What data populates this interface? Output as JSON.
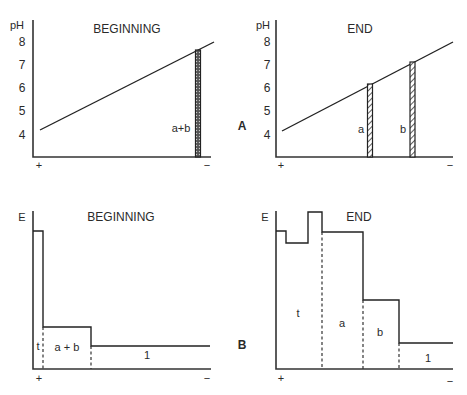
{
  "panels": {
    "A": {
      "letter": "A",
      "y_axis_label": "pH",
      "y_ticks": [
        "8",
        "7",
        "6",
        "5",
        "4"
      ],
      "x_left_sign": "+",
      "x_right_sign": "−",
      "beginning": {
        "title": "BEGINNING",
        "gradient": {
          "from_ph": 4.2,
          "to_ph": 8.0
        },
        "bands": [
          {
            "label": "a+b",
            "position_fraction": 0.92,
            "ph": 7.6
          }
        ]
      },
      "end": {
        "title": "END",
        "gradient": {
          "from_ph": 4.2,
          "to_ph": 8.0
        },
        "bands": [
          {
            "label": "a",
            "position_fraction": 0.52,
            "ph": 6.1
          },
          {
            "label": "b",
            "position_fraction": 0.76,
            "ph": 7.0
          }
        ]
      }
    },
    "B": {
      "letter": "B",
      "y_axis_label": "E",
      "x_left_sign": "+",
      "x_right_sign": "−",
      "beginning": {
        "title": "BEGINNING",
        "zones": [
          {
            "label": "t",
            "relative_E": 0.87
          },
          {
            "label": "a + b",
            "relative_E": 0.27
          },
          {
            "label": "1",
            "relative_E": 0.15
          }
        ]
      },
      "end": {
        "title": "END",
        "zones": [
          {
            "label": "t",
            "relative_E": 0.87
          },
          {
            "label": "a",
            "relative_E": 0.87
          },
          {
            "label": "b",
            "relative_E": 0.44
          },
          {
            "label": "1",
            "relative_E": 0.17
          }
        ]
      }
    }
  }
}
